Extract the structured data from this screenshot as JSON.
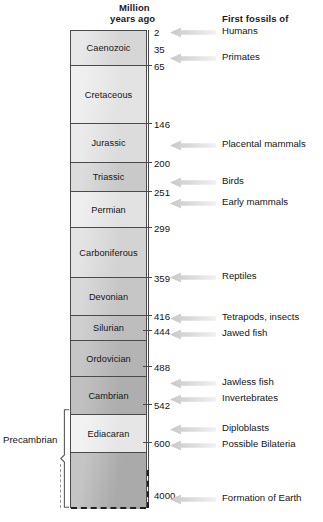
{
  "headers": {
    "million": "Million",
    "years_ago": "years ago",
    "first_fossils_of": "First fossils of"
  },
  "precambrian": {
    "label": "Precambrian"
  },
  "chart_data": {
    "type": "table",
    "xlabel": "",
    "ylabel": "Million years ago",
    "ylim": [
      0,
      4000
    ],
    "grid": false,
    "legend_position": "none",
    "axis_unit": "Million years ago",
    "boundaries_mya": [
      2,
      35,
      65,
      146,
      200,
      251,
      299,
      359,
      416,
      444,
      488,
      542,
      600,
      4000
    ],
    "periods": [
      {
        "name": "Caenozoic",
        "start_mya": 65,
        "end_mya": 2,
        "shade": "#d6d6d6",
        "shade2": "#e8e8e8"
      },
      {
        "name": "Cretaceous",
        "start_mya": 146,
        "end_mya": 65,
        "shade": "#e3e3e3",
        "shade2": "#efefef"
      },
      {
        "name": "Jurassic",
        "start_mya": 200,
        "end_mya": 146,
        "shade": "#dcdcdc",
        "shade2": "#eaeaea"
      },
      {
        "name": "Triassic",
        "start_mya": 251,
        "end_mya": 200,
        "shade": "#c9c9c9",
        "shade2": "#dcdcdc"
      },
      {
        "name": "Permian",
        "start_mya": 299,
        "end_mya": 251,
        "shade": "#e2e2e2",
        "shade2": "#eeeeee"
      },
      {
        "name": "Carboniferous",
        "start_mya": 359,
        "end_mya": 299,
        "shade": "#d3d3d3",
        "shade2": "#e3e3e3"
      },
      {
        "name": "Devonian",
        "start_mya": 416,
        "end_mya": 359,
        "shade": "#c6c6c6",
        "shade2": "#d8d8d8"
      },
      {
        "name": "Silurian",
        "start_mya": 444,
        "end_mya": 416,
        "shade": "#bdbdbd",
        "shade2": "#cfcfcf"
      },
      {
        "name": "Ordovician",
        "start_mya": 488,
        "end_mya": 444,
        "shade": "#b4b4b4",
        "shade2": "#c6c6c6"
      },
      {
        "name": "Cambrian",
        "start_mya": 542,
        "end_mya": 488,
        "shade": "#aeaeae",
        "shade2": "#c0c0c0"
      },
      {
        "name": "Ediacaran",
        "start_mya": 600,
        "end_mya": 542,
        "shade": "#e6e6e6",
        "shade2": "#f2f2f2"
      },
      {
        "name": "",
        "start_mya": 4000,
        "end_mya": 600,
        "shade": "#aaaaaa",
        "shade2": "#c4c4c4"
      }
    ],
    "tick_labels": [
      "2",
      "35",
      "65",
      "146",
      "200",
      "251",
      "299",
      "359",
      "416",
      "444",
      "488",
      "542",
      "600",
      "4000"
    ],
    "events": [
      {
        "label": "Humans",
        "mya": 2
      },
      {
        "label": "Primates",
        "mya": 35
      },
      {
        "label": "Placental mammals",
        "mya": 125
      },
      {
        "label": "Birds",
        "mya": 190
      },
      {
        "label": "Early mammals",
        "mya": 235
      },
      {
        "label": "Reptiles",
        "mya": 345
      },
      {
        "label": "Tetrapods, insects",
        "mya": 410
      },
      {
        "label": "Jawed fish",
        "mya": 440
      },
      {
        "label": "Jawless fish",
        "mya": 515
      },
      {
        "label": "Invertebrates",
        "mya": 540
      },
      {
        "label": "Diploblasts",
        "mya": 570
      },
      {
        "label": "Possible Bilateria",
        "mya": 590
      },
      {
        "label": "Formation of Earth",
        "mya": 4000
      }
    ]
  },
  "layout": {
    "bands": [
      {
        "top": 0,
        "height": 35,
        "divider": true
      },
      {
        "top": 35,
        "height": 58,
        "divider": true
      },
      {
        "top": 93,
        "height": 39,
        "divider": true
      },
      {
        "top": 132,
        "height": 29,
        "divider": true
      },
      {
        "top": 161,
        "height": 36,
        "divider": true
      },
      {
        "top": 197,
        "height": 50,
        "divider": true
      },
      {
        "top": 247,
        "height": 38,
        "divider": true
      },
      {
        "top": 285,
        "height": 25,
        "divider": true
      },
      {
        "top": 310,
        "height": 36,
        "divider": true
      },
      {
        "top": 346,
        "height": 38,
        "divider": true
      },
      {
        "top": 384,
        "height": 38,
        "divider": true
      },
      {
        "top": 422,
        "height": 56,
        "divider": false
      }
    ],
    "ticks": [
      {
        "top": 30,
        "label_top": 28,
        "line": false
      },
      {
        "top": 48,
        "label_top": 45,
        "line": false
      },
      {
        "top": 65,
        "label_top": 62,
        "line": true
      },
      {
        "top": 123,
        "label_top": 120,
        "line": true
      },
      {
        "top": 162,
        "label_top": 159,
        "line": true
      },
      {
        "top": 191,
        "label_top": 188,
        "line": true
      },
      {
        "top": 227,
        "label_top": 224,
        "line": true
      },
      {
        "top": 277,
        "label_top": 274,
        "line": true
      },
      {
        "top": 315,
        "label_top": 312,
        "line": true
      },
      {
        "top": 330,
        "label_top": 327,
        "line": true
      },
      {
        "top": 366,
        "label_top": 363,
        "line": true
      },
      {
        "top": 404,
        "label_top": 401,
        "line": true
      },
      {
        "top": 442,
        "label_top": 439,
        "line": true
      },
      {
        "top": 500,
        "label_top": 491,
        "line": false
      }
    ],
    "arrows": [
      {
        "top": 27,
        "label_top": 25
      },
      {
        "top": 53,
        "label_top": 51
      },
      {
        "top": 140,
        "label_top": 138
      },
      {
        "top": 177,
        "label_top": 175
      },
      {
        "top": 198,
        "label_top": 196
      },
      {
        "top": 272,
        "label_top": 270
      },
      {
        "top": 313,
        "label_top": 311
      },
      {
        "top": 329,
        "label_top": 327
      },
      {
        "top": 378,
        "label_top": 376
      },
      {
        "top": 394,
        "label_top": 392
      },
      {
        "top": 424,
        "label_top": 422
      },
      {
        "top": 440,
        "label_top": 438
      },
      {
        "top": 494,
        "label_top": 492
      }
    ]
  }
}
